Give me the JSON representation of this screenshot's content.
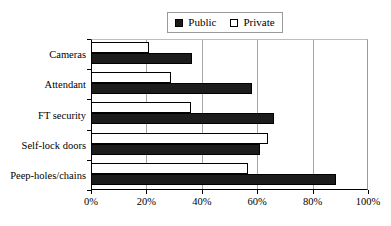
{
  "chart_data": {
    "type": "bar",
    "orientation": "horizontal",
    "title": "",
    "subtitle": "",
    "xlabel": "",
    "ylabel": "",
    "categories": [
      "Cameras",
      "Attendant",
      "FT security",
      "Self-lock doors",
      "Peep-holes/chains"
    ],
    "series": [
      {
        "name": "Public",
        "values": [
          36.5,
          58.0,
          66.0,
          61.0,
          88.5
        ],
        "color": "#1c1c1c",
        "swatch": "filled"
      },
      {
        "name": "Private",
        "values": [
          21.0,
          29.0,
          36.0,
          64.0,
          56.5
        ],
        "color": "#ffffff",
        "swatch": "hollow"
      }
    ],
    "xlim": [
      0,
      100
    ],
    "xtick_values": [
      0,
      20,
      40,
      60,
      80,
      100
    ],
    "xtick_labels": [
      "0%",
      "20%",
      "40%",
      "60%",
      "80%",
      "100%"
    ],
    "grid": "vertical",
    "legend_position": "top-center",
    "legend_entries": [
      "Public",
      "Private"
    ],
    "units": "percent"
  },
  "legend": {
    "items": [
      {
        "label": "Public"
      },
      {
        "label": "Private"
      }
    ]
  },
  "axes": {
    "x_tick_labels": [
      "0%",
      "20%",
      "40%",
      "60%",
      "80%",
      "100%"
    ],
    "y_tick_labels": [
      "Cameras",
      "Attendant",
      "FT security",
      "Self-lock doors",
      "Peep-holes/chains"
    ]
  }
}
